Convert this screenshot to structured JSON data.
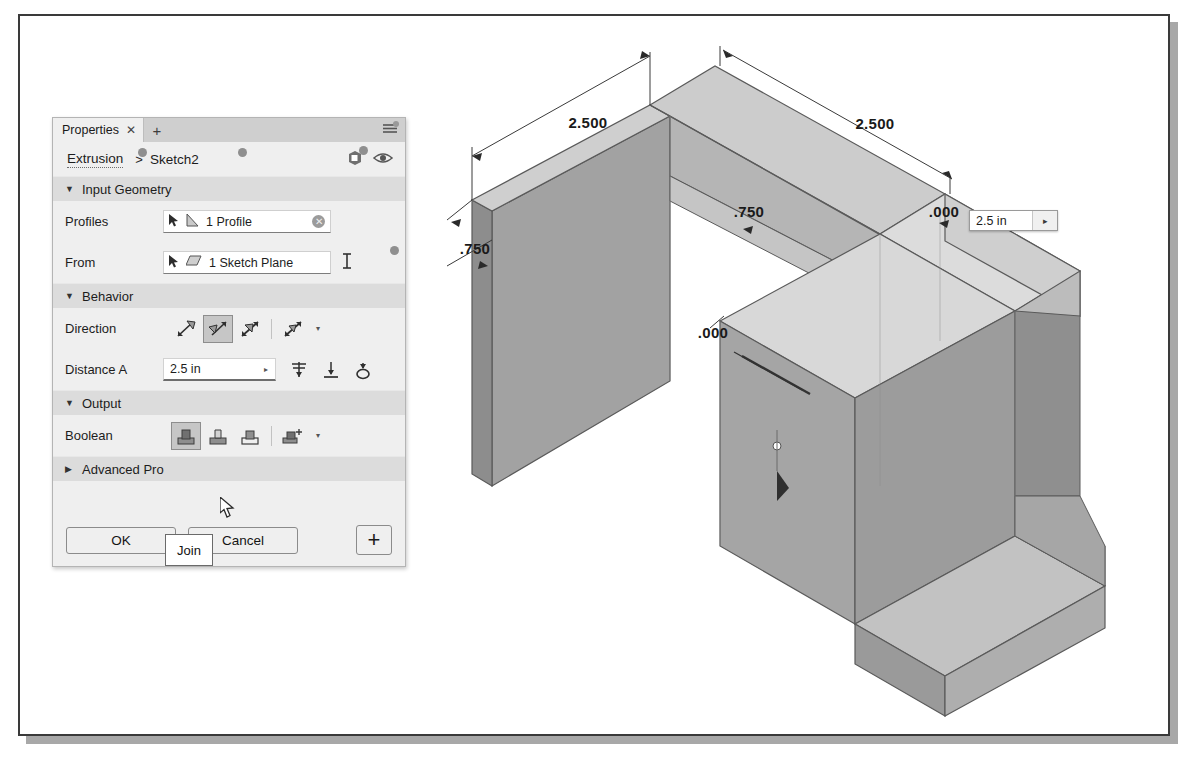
{
  "app": {
    "context": "autodesk-inventor-extrude-dialog"
  },
  "panel": {
    "tab_label": "Properties",
    "tab_close_icon": "close-icon",
    "tab_add_icon": "plus-icon",
    "menu_icon": "hamburger-menu-icon",
    "breadcrumb": {
      "parent": "Extrusion",
      "separator": ">",
      "current": "Sketch2"
    },
    "header_icons": [
      {
        "name": "body-preview-icon"
      },
      {
        "name": "eye-visibility-icon"
      }
    ],
    "sections": [
      {
        "id": "input-geometry",
        "title": "Input Geometry",
        "expanded": true,
        "caret": "▼",
        "rows": [
          {
            "label": "Profiles",
            "field_value": "1 Profile",
            "select_icon": "cursor-arrow-icon",
            "type_icon": "profile-shape-icon",
            "clear_icon": "clear-selection-icon",
            "clear_glyph": "✕"
          },
          {
            "label": "From",
            "field_value": "1 Sketch Plane",
            "select_icon": "cursor-arrow-icon",
            "type_icon": "sketch-plane-icon",
            "trailing_icon": "flip-start-icon"
          }
        ]
      },
      {
        "id": "behavior",
        "title": "Behavior",
        "expanded": true,
        "caret": "▼",
        "direction": {
          "label": "Direction",
          "options": [
            {
              "name": "direction-default-icon",
              "selected": false
            },
            {
              "name": "direction-flipped-icon",
              "selected": true
            },
            {
              "name": "direction-symmetric-icon",
              "selected": false
            },
            {
              "name": "direction-asymmetric-icon",
              "selected": false
            }
          ],
          "more_caret": "▾"
        },
        "distance": {
          "label": "Distance A",
          "value": "2.5 in",
          "caret": "▸",
          "icons": [
            {
              "name": "taper-angle-icon"
            },
            {
              "name": "to-next-icon"
            },
            {
              "name": "measure-icon"
            }
          ]
        }
      },
      {
        "id": "output",
        "title": "Output",
        "expanded": true,
        "caret": "▼",
        "boolean": {
          "label": "Boolean",
          "options": [
            {
              "name": "boolean-join-icon",
              "label": "Join",
              "selected": true
            },
            {
              "name": "boolean-cut-icon",
              "label": "Cut",
              "selected": false
            },
            {
              "name": "boolean-intersect-icon",
              "label": "Intersect",
              "selected": false
            },
            {
              "name": "boolean-new-solid-icon",
              "label": "New Solid",
              "selected": false
            }
          ],
          "more_caret": "▾"
        }
      },
      {
        "id": "advanced-properties",
        "title": "Advanced Pro",
        "expanded": false,
        "caret": "▶"
      }
    ],
    "tooltip": {
      "text": "Join",
      "target": "boolean-join-icon"
    },
    "footer": {
      "ok_label": "OK",
      "cancel_label": "Cancel",
      "add_label": "+",
      "add_icon": "plus-icon"
    }
  },
  "viewport": {
    "cursor_icon": "arrow-cursor-icon",
    "inline_value": {
      "value": "2.5 in",
      "arrow_glyph": "▸",
      "arrow_icon": "expand-arrow-icon"
    },
    "dimensions": [
      {
        "name": "dim-top-left",
        "text": "2.500",
        "x": 568,
        "y": 112
      },
      {
        "name": "dim-top-right",
        "text": "2.500",
        "x": 855,
        "y": 113
      },
      {
        "name": "dim-left-depth",
        "text": ".750",
        "x": 455,
        "y": 236
      },
      {
        "name": "dim-mid-750",
        "text": ".750",
        "x": 729,
        "y": 200
      },
      {
        "name": "dim-right-000",
        "text": ".000",
        "x": 924,
        "y": 200
      },
      {
        "name": "dim-center-000",
        "text": ".000",
        "x": 693,
        "y": 321
      }
    ],
    "model": {
      "type": "isometric-solid-block",
      "face_colors": {
        "top_light": "#d6d6d6",
        "top_mid": "#c9c9c9",
        "front_dark": "#9e9e9e",
        "side_mid": "#b0b0b0",
        "side_dark": "#8e8e8e",
        "preview_light": "#dadada"
      },
      "edge_color": "#5a5a5a",
      "background": "#ffffff"
    }
  }
}
